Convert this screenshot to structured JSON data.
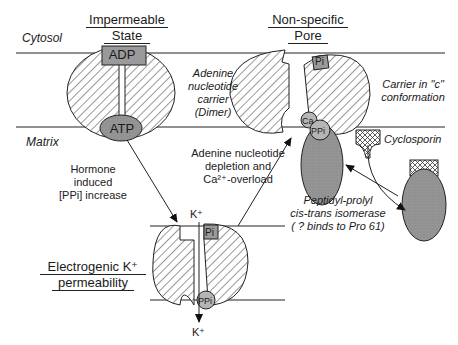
{
  "compartments": {
    "cytosol": "Cytosol",
    "matrix": "Matrix"
  },
  "states": {
    "impermeable": {
      "line1": "Impermeable",
      "line2": "State"
    },
    "pore": {
      "line1": "Non-specific",
      "line2": "Pore"
    },
    "electrogenic": {
      "line1": "Electrogenic K⁺",
      "line2": "permeability"
    }
  },
  "molecules": {
    "adp": "ADP",
    "atp": "ATP",
    "pi": "Pi",
    "ppi": "PPi",
    "ca": "Ca",
    "k_in": "K⁺",
    "k_out": "K⁺"
  },
  "annotations": {
    "carrier_dimer": [
      "Adenine",
      "nucleotide",
      "carrier",
      "(Dimer)"
    ],
    "carrier_c": [
      "Carrier in \"c\"",
      "conformation"
    ],
    "hormone": [
      "Hormone",
      "induced",
      "[PPi] increase"
    ],
    "depletion": [
      "Adenine nucleotide",
      "depletion and",
      "Ca²⁺-overload"
    ],
    "cyclosporin": "Cyclosporin",
    "isomerase": [
      "Peptidyl-prolyl",
      "cis-trans isomerase",
      "( ? binds to Pro 61)"
    ]
  },
  "colors": {
    "line": "#222222",
    "box_fill": "#9a9a9a",
    "ellipse_fill": "#8f8f8f",
    "bg": "#ffffff"
  }
}
